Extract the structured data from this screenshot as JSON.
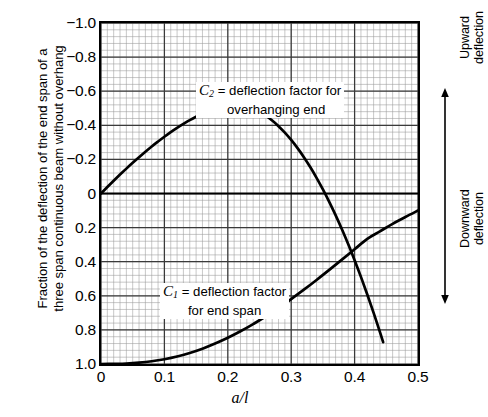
{
  "chart_data": {
    "type": "line",
    "title": "",
    "xlabel": "a/l",
    "ylabel": "Fraction of the deflection of the end span of a three span continuous beam without overhang",
    "ylabel_line1": "Fraction of the deflection of the end span of a",
    "ylabel_line2": "three span continuous beam without overhang",
    "xlim": [
      0,
      0.5
    ],
    "ylim": [
      1.0,
      -1.0
    ],
    "y_axis_inverted": true,
    "grid": "on",
    "grid_minor": "on",
    "x_major_step": 0.1,
    "x_minor_step": 0.01,
    "y_major_step": 0.2,
    "y_minor_step": 0.04,
    "xticks": [
      "0",
      "0.1",
      "0.2",
      "0.3",
      "0.4",
      "0.5"
    ],
    "xtick_values": [
      0,
      0.1,
      0.2,
      0.3,
      0.4,
      0.5
    ],
    "yticks": [
      "−1.0",
      "−0.8",
      "−0.6",
      "−0.4",
      "−0.2",
      "0",
      "0.2",
      "0.4",
      "0.6",
      "0.8",
      "1.0"
    ],
    "ytick_values": [
      -1.0,
      -0.8,
      -0.6,
      -0.4,
      -0.2,
      0,
      0.2,
      0.4,
      0.6,
      0.8,
      1.0
    ],
    "zero_line": 0,
    "legend_position": "inline-annotations",
    "series": [
      {
        "name": "C2",
        "label_prefix": "C",
        "label_subscript": "2",
        "label_text": "= deflection factor for",
        "label_text_line2": "overhanging end",
        "color": "#000000",
        "x": [
          0,
          0.01,
          0.02,
          0.03,
          0.04,
          0.05,
          0.06,
          0.07,
          0.08,
          0.09,
          0.1,
          0.11,
          0.12,
          0.13,
          0.14,
          0.15,
          0.16,
          0.17,
          0.18,
          0.19,
          0.2,
          0.21,
          0.22,
          0.23,
          0.24,
          0.25,
          0.26,
          0.27,
          0.28,
          0.29,
          0.3,
          0.31,
          0.32,
          0.33,
          0.34,
          0.35,
          0.36,
          0.37,
          0.38,
          0.39,
          0.4,
          0.41,
          0.42,
          0.43,
          0.44,
          0.445
        ],
        "y": [
          0.0,
          -0.038,
          -0.075,
          -0.111,
          -0.146,
          -0.18,
          -0.213,
          -0.245,
          -0.276,
          -0.305,
          -0.333,
          -0.36,
          -0.385,
          -0.408,
          -0.43,
          -0.45,
          -0.468,
          -0.484,
          -0.498,
          -0.51,
          -0.518,
          -0.521,
          -0.518,
          -0.51,
          -0.497,
          -0.479,
          -0.456,
          -0.428,
          -0.395,
          -0.357,
          -0.314,
          -0.266,
          -0.213,
          -0.155,
          -0.092,
          -0.024,
          0.049,
          0.127,
          0.21,
          0.298,
          0.391,
          0.489,
          0.592,
          0.7,
          0.813,
          0.872
        ]
      },
      {
        "name": "C1",
        "label_prefix": "C",
        "label_subscript": "1",
        "label_text": "= deflection factor",
        "label_text_line2": "for end span",
        "color": "#000000",
        "x": [
          0,
          0.02,
          0.04,
          0.06,
          0.08,
          0.1,
          0.12,
          0.14,
          0.16,
          0.18,
          0.2,
          0.22,
          0.24,
          0.26,
          0.28,
          0.3,
          0.32,
          0.34,
          0.36,
          0.38,
          0.4,
          0.42,
          0.44,
          0.46,
          0.48,
          0.5
        ],
        "y": [
          1.0,
          0.999,
          0.997,
          0.992,
          0.984,
          0.972,
          0.956,
          0.935,
          0.91,
          0.88,
          0.846,
          0.808,
          0.766,
          0.72,
          0.671,
          0.619,
          0.564,
          0.507,
          0.448,
          0.388,
          0.327,
          0.266,
          0.222,
          0.178,
          0.138,
          0.1
        ]
      }
    ],
    "annotations": [
      {
        "name": "upward-deflection",
        "text_line1": "Upward",
        "text_line2": "deflection",
        "arrow": "up"
      },
      {
        "name": "downward-deflection",
        "text_line1": "Downward",
        "text_line2": "deflection",
        "arrow": "down"
      }
    ]
  }
}
